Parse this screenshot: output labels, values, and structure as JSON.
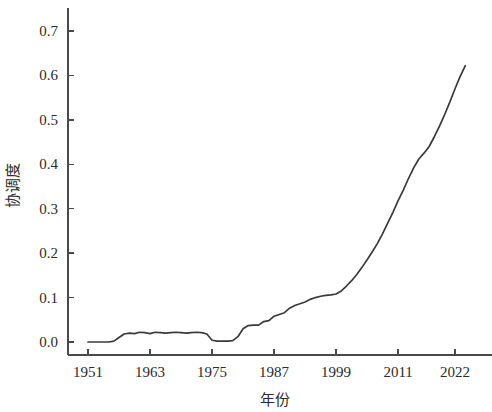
{
  "chart_data": {
    "type": "line",
    "title": "",
    "xlabel": "年份",
    "ylabel": "协调度",
    "xlim": [
      1951,
      2024
    ],
    "ylim": [
      0.0,
      0.745
    ],
    "grid": false,
    "legend": null,
    "x_tick_labels": [
      "1951",
      "1963",
      "1975",
      "1987",
      "1999",
      "2011",
      "2022"
    ],
    "x_tick_values": [
      1951,
      1963,
      1975,
      1987,
      1999,
      2011,
      2022
    ],
    "y_tick_labels": [
      "0.0",
      "0.1",
      "0.2",
      "0.3",
      "0.4",
      "0.5",
      "0.6",
      "0.7"
    ],
    "y_tick_values": [
      0.0,
      0.1,
      0.2,
      0.3,
      0.4,
      0.5,
      0.6,
      0.7
    ],
    "line_color": "#3a3a3a",
    "series": [
      {
        "name": "协调度",
        "x": [
          1951,
          1952,
          1953,
          1954,
          1955,
          1956,
          1957,
          1958,
          1959,
          1960,
          1961,
          1962,
          1963,
          1964,
          1965,
          1966,
          1967,
          1968,
          1969,
          1970,
          1971,
          1972,
          1973,
          1974,
          1975,
          1976,
          1977,
          1978,
          1979,
          1980,
          1981,
          1982,
          1983,
          1984,
          1985,
          1986,
          1987,
          1988,
          1989,
          1990,
          1991,
          1992,
          1993,
          1994,
          1995,
          1996,
          1997,
          1998,
          1999,
          2000,
          2001,
          2002,
          2003,
          2004,
          2005,
          2006,
          2007,
          2008,
          2009,
          2010,
          2011,
          2012,
          2013,
          2014,
          2015,
          2016,
          2017,
          2018,
          2019,
          2020,
          2021,
          2022,
          2023,
          2024
        ],
        "values": [
          0.0,
          0.0,
          0.0,
          0.0,
          0.0,
          0.002,
          0.01,
          0.018,
          0.02,
          0.019,
          0.022,
          0.021,
          0.019,
          0.022,
          0.021,
          0.02,
          0.021,
          0.022,
          0.021,
          0.02,
          0.021,
          0.022,
          0.021,
          0.018,
          0.004,
          0.002,
          0.002,
          0.002,
          0.003,
          0.012,
          0.03,
          0.037,
          0.038,
          0.038,
          0.046,
          0.048,
          0.058,
          0.062,
          0.066,
          0.076,
          0.082,
          0.086,
          0.09,
          0.096,
          0.1,
          0.103,
          0.105,
          0.106,
          0.108,
          0.115,
          0.126,
          0.138,
          0.152,
          0.168,
          0.185,
          0.203,
          0.222,
          0.244,
          0.268,
          0.292,
          0.318,
          0.342,
          0.368,
          0.392,
          0.412,
          0.425,
          0.44,
          0.462,
          0.486,
          0.512,
          0.54,
          0.57,
          0.598,
          0.622
        ]
      }
    ]
  },
  "axes": {
    "x_title": "年份",
    "y_title": "协调度"
  }
}
